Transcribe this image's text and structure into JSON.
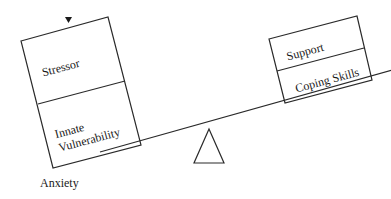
{
  "diagram": {
    "left_box": {
      "top_label": "Stressor",
      "bottom_label_line1": "Innate",
      "bottom_label_line2": "Vulnerability"
    },
    "right_box": {
      "top_label": "Support",
      "bottom_label": "Coping Skills"
    },
    "outcome_label": "Anxiety",
    "colors": {
      "stroke": "#2a2a2a",
      "background": "#ffffff",
      "text": "#1a1a1a"
    }
  }
}
